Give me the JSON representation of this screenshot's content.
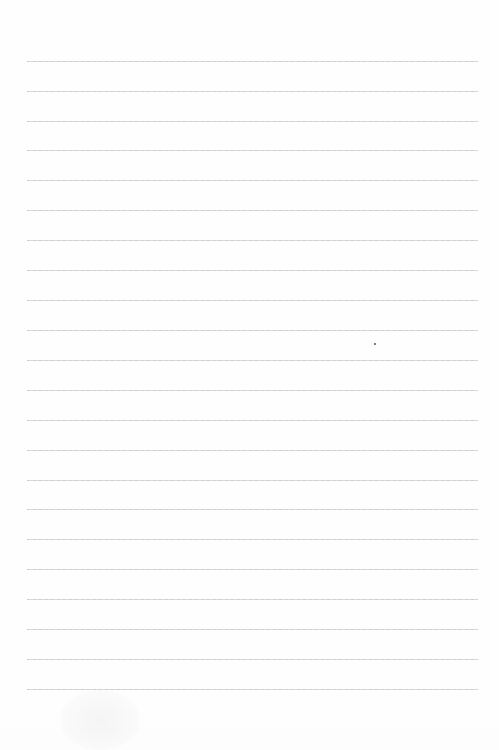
{
  "document": {
    "type": "lined-paper",
    "background_color": "#fefefe",
    "rule_color": "#c8c8c8",
    "rule_left_x": 27,
    "rule_right_x": 478,
    "rule_positions_y": [
      61,
      91,
      121,
      150,
      180,
      210,
      240,
      270,
      300,
      330,
      360,
      390,
      420,
      450,
      480,
      509,
      539,
      569,
      599,
      629,
      659,
      689
    ],
    "text_content": ""
  }
}
